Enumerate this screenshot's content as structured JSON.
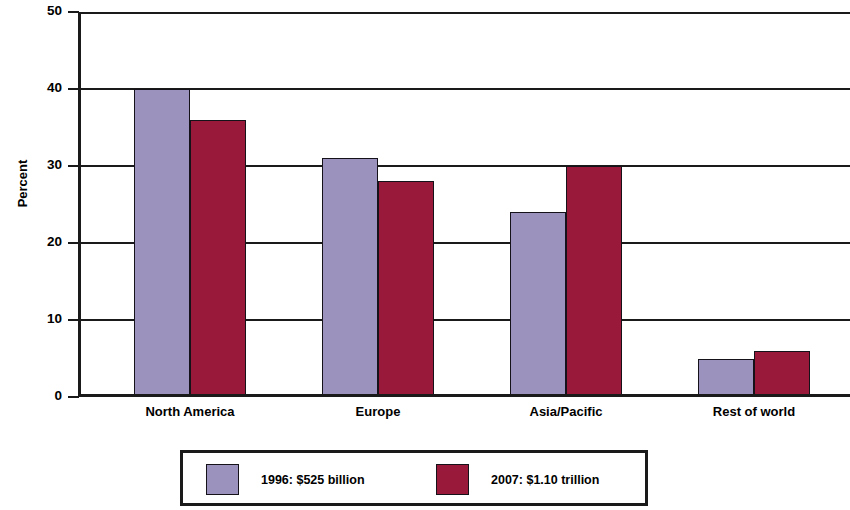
{
  "chart_data": {
    "type": "bar",
    "title": "",
    "subtitle": "",
    "xlabel": "",
    "ylabel": "Percent",
    "ylim": [
      0,
      50
    ],
    "yticks": [
      0,
      10,
      20,
      30,
      40,
      50
    ],
    "ytick_labels": [
      "0",
      "10",
      "20",
      "30",
      "40",
      "50"
    ],
    "grid": true,
    "grid_axis": "y",
    "legend_position": "bottom-center",
    "categories": [
      "North America",
      "Europe",
      "Asia/Pacific",
      "Rest of world"
    ],
    "series": [
      {
        "name": "1996: $525 billion",
        "color": "#9b92be",
        "values": [
          40,
          31,
          24,
          5
        ]
      },
      {
        "name": "2007: $1.10 trillion",
        "color": "#99193a",
        "values": [
          36,
          28,
          30,
          6
        ]
      }
    ],
    "colors": {
      "series_1": "#9b92be",
      "series_2": "#99193a",
      "axis": "#1a1a1a",
      "background": "#ffffff"
    }
  }
}
